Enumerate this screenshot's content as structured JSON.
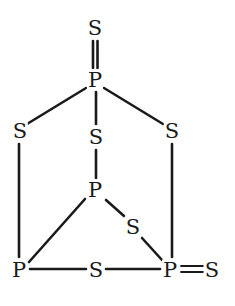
{
  "diagram": {
    "atoms": [
      {
        "id": "s_top",
        "label": "S",
        "x": 95,
        "y": 28
      },
      {
        "id": "p_top",
        "label": "P",
        "x": 95,
        "y": 80
      },
      {
        "id": "s_left",
        "label": "S",
        "x": 20,
        "y": 131
      },
      {
        "id": "s_center",
        "label": "S",
        "x": 96,
        "y": 137
      },
      {
        "id": "s_right",
        "label": "S",
        "x": 172,
        "y": 131
      },
      {
        "id": "p_center",
        "label": "P",
        "x": 95,
        "y": 190
      },
      {
        "id": "s_midright",
        "label": "S",
        "x": 133,
        "y": 227
      },
      {
        "id": "p_bottomleft",
        "label": "P",
        "x": 19,
        "y": 270
      },
      {
        "id": "s_bottom",
        "label": "S",
        "x": 96,
        "y": 270
      },
      {
        "id": "p_bottomright",
        "label": "P",
        "x": 170,
        "y": 270
      },
      {
        "id": "s_farright",
        "label": "S",
        "x": 212,
        "y": 270
      }
    ],
    "bonds": [
      {
        "from": "s_top",
        "to": "p_top",
        "order": 2,
        "style": "double-vertical"
      },
      {
        "from": "p_top",
        "to": "s_left",
        "order": 1
      },
      {
        "from": "p_top",
        "to": "s_center",
        "order": 1
      },
      {
        "from": "p_top",
        "to": "s_right",
        "order": 1
      },
      {
        "from": "s_center",
        "to": "p_center",
        "order": 1
      },
      {
        "from": "s_left",
        "to": "p_bottomleft",
        "order": 1
      },
      {
        "from": "s_right",
        "to": "p_bottomright",
        "order": 1
      },
      {
        "from": "p_center",
        "to": "p_bottomleft",
        "order": 1
      },
      {
        "from": "p_center",
        "to": "s_midright",
        "order": 1
      },
      {
        "from": "s_midright",
        "to": "p_bottomright",
        "order": 1
      },
      {
        "from": "p_bottomleft",
        "to": "s_bottom",
        "order": 1
      },
      {
        "from": "s_bottom",
        "to": "p_bottomright",
        "order": 1
      },
      {
        "from": "p_bottomright",
        "to": "s_farright",
        "order": 2
      }
    ]
  }
}
